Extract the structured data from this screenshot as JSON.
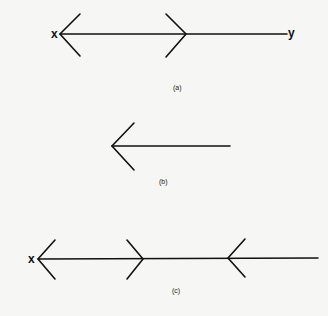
{
  "figures": [
    {
      "id": "a",
      "caption": "(a)",
      "left_label": "x",
      "right_label": "y",
      "description": "Line x–y with arrowhead at x pointing left and a rightward chevron mid-line"
    },
    {
      "id": "b",
      "caption": "(b)",
      "description": "Single left-pointing arrow"
    },
    {
      "id": "c",
      "caption": "(c)",
      "left_label": "x",
      "description": "Line from x with left arrowhead, a rightward chevron, and a leftward chevron"
    }
  ],
  "colors": {
    "stroke": "#111111",
    "background": "#f6f6f4"
  }
}
